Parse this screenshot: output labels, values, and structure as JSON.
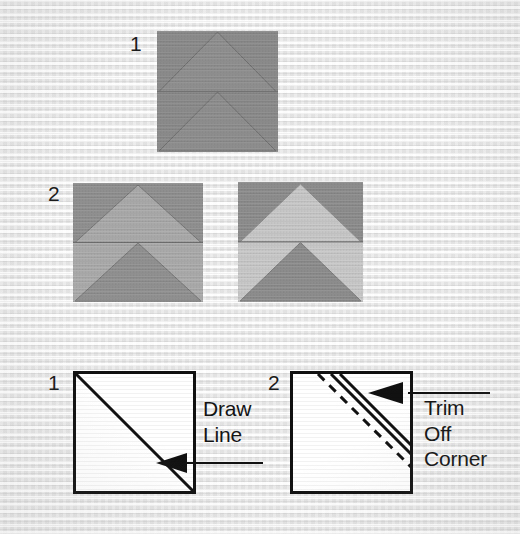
{
  "diagram": {
    "background_color": "#f0f0f0"
  },
  "rows": [
    {
      "id": "row-1",
      "step_label": "1",
      "label_x": 130,
      "label_y": 33,
      "blocks": [
        {
          "id": "block-1-a",
          "name": "finished-chevron-block-monotone",
          "x": 157,
          "y": 31,
          "width": 121,
          "height": 121,
          "fabric_top_background": "#8a8a8a",
          "fabric_top_triangle": "#8d8d8d",
          "fabric_bottom_background": "#8a8a8a",
          "fabric_bottom_triangle": "#8d8d8d",
          "seam_color": "#6a6a6a"
        }
      ]
    },
    {
      "id": "row-2",
      "step_label": "2",
      "label_x": 48,
      "label_y": 183,
      "blocks": [
        {
          "id": "block-2-a",
          "name": "chevron-block-low-contrast",
          "x": 73,
          "y": 183,
          "width": 130,
          "height": 119,
          "fabric_top_background": "#8e8e8e",
          "fabric_top_triangle": "#a8a8a8",
          "fabric_bottom_background": "#a9a9a9",
          "fabric_bottom_triangle": "#8f8f8f",
          "seam_color": "#6d6d6d"
        },
        {
          "id": "block-2-b",
          "name": "chevron-block-high-contrast",
          "x": 238,
          "y": 182,
          "width": 125,
          "height": 120,
          "fabric_top_background": "#8b8b8b",
          "fabric_top_triangle": "#c6c6c6",
          "fabric_bottom_background": "#c7c7c7",
          "fabric_bottom_triangle": "#8b8b8b",
          "seam_color": "#6a6a6a"
        }
      ]
    }
  ],
  "instructions": [
    {
      "id": "panel-1",
      "step_label": "1",
      "label_x": 48,
      "label_y": 372,
      "square": {
        "x": 73,
        "y": 371,
        "width": 123,
        "height": 123
      },
      "fabric_color": "#ffffff",
      "outline_color": "#111111",
      "guide_line": {
        "type": "solid",
        "from": "top-left",
        "to": "bottom-right"
      },
      "callout_text": "Draw\nLine",
      "callout_x": 203,
      "callout_y": 396,
      "arrow_target": "diagonal-line-midpoint"
    },
    {
      "id": "panel-2",
      "step_label": "2",
      "label_x": 268,
      "label_y": 372,
      "square": {
        "x": 290,
        "y": 371,
        "width": 123,
        "height": 123
      },
      "fabric_color": "#ffffff",
      "outline_color": "#111111",
      "guide_line": {
        "type": "dashed-plus-double-solid",
        "corner": "top-right"
      },
      "callout_text": "Trim\nOff\nCorner",
      "callout_x": 424,
      "callout_y": 395,
      "arrow_target": "trimmed-corner"
    }
  ]
}
